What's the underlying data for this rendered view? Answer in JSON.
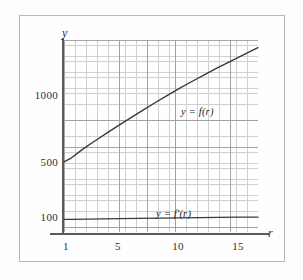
{
  "figure": {
    "background_color": "#fdfdfc",
    "frame_color": "#b7b7b4",
    "axis_color": "#5b5b5b",
    "grid_color": "#c9c9c9",
    "grid_major_color": "#9a9a9a",
    "curve_color": "#3a3a3a"
  },
  "axes": {
    "y_axis_name": "y",
    "x_axis_name": "r"
  },
  "labels": {
    "curve_f": "y = f(r)",
    "curve_fprime": "y = f′(r)"
  },
  "ticks": {
    "y": [
      {
        "label": "100",
        "value": 100,
        "top": 217
      },
      {
        "label": "500",
        "value": 500,
        "top": 162
      },
      {
        "label": "1000",
        "value": 1000,
        "top": 95
      }
    ],
    "x": [
      {
        "label": "1",
        "value": 1,
        "left": 66
      },
      {
        "label": "5",
        "value": 5,
        "left": 118
      },
      {
        "label": "10",
        "value": 10,
        "left": 178
      },
      {
        "label": "15",
        "value": 15,
        "left": 238
      }
    ]
  },
  "chart_data": {
    "type": "line",
    "title": "",
    "xlabel": "r",
    "ylabel": "y",
    "yscale": "log",
    "xscale": "linear",
    "grid": true,
    "grid_style": "semi-log graph paper",
    "legend": "inline curve labels",
    "xlim": [
      0.4,
      16.6
    ],
    "ylim": [
      72,
      1500
    ],
    "xticks": [
      1,
      5,
      10,
      15
    ],
    "yticks": [
      100,
      500,
      1000
    ],
    "series": [
      {
        "name": "y = f(r)",
        "label_position": "above curve near r = 10.5",
        "x": [
          0.4,
          1,
          2,
          3,
          4,
          5,
          6,
          7,
          8,
          9,
          10,
          11,
          12,
          13,
          14,
          15,
          16,
          16.6
        ],
        "y": [
          218,
          232,
          268,
          305,
          345,
          390,
          440,
          495,
          556,
          622,
          694,
          772,
          855,
          945,
          1042,
          1146,
          1258,
          1330
        ]
      },
      {
        "name": "y = f′(r)",
        "label_position": "above line near r = 8.5",
        "x": [
          0.4,
          1,
          5,
          10,
          15,
          16.6
        ],
        "y": [
          88,
          88,
          89,
          90,
          91,
          91
        ]
      }
    ]
  }
}
